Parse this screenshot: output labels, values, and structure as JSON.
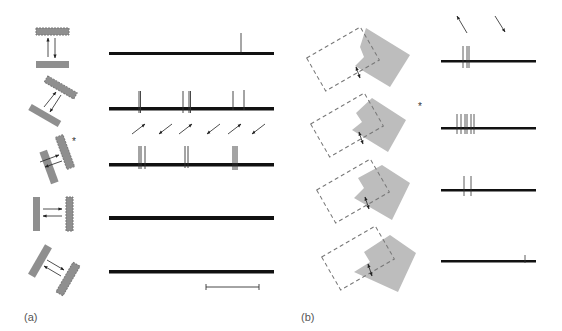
{
  "figure": {
    "panel_a": {
      "label": "(a)",
      "rows": [
        {
          "stimulus": "horizontal-bars-vertical-motion",
          "spikes_x": [
            241
          ],
          "y": 53
        },
        {
          "stimulus": "oblique-bars-upright-motion",
          "spikes_x": [
            139,
            183,
            189,
            232,
            243
          ],
          "y": 108
        },
        {
          "stimulus": "oblique-bars-lower-left-motion-preferred",
          "starred": true,
          "spikes_x": [
            139,
            141,
            145,
            185,
            188,
            233,
            235,
            237
          ],
          "y": 164
        },
        {
          "stimulus": "vertical-bars-horizontal-motion",
          "spikes_x": [],
          "y": 218
        },
        {
          "stimulus": "oblique-bars-reverse-motion",
          "spikes_x": [],
          "y": 272
        }
      ],
      "direction_arrows": [
        "up-right",
        "down-left",
        "up-right",
        "down-left",
        "up-right",
        "down-left"
      ],
      "scale_bar": {
        "x1": 206,
        "x2": 259,
        "y": 287
      }
    },
    "panel_b": {
      "label": "(b)",
      "top_arrows": [
        "up-left",
        "down-right"
      ],
      "rows": [
        {
          "stimulus": "occluded-corner-1",
          "spikes_x": [
            463,
            467,
            469
          ],
          "y": 61
        },
        {
          "stimulus": "occluded-corner-2",
          "starred": true,
          "spikes_x": [
            457,
            461,
            465,
            467,
            471,
            474
          ],
          "y": 128
        },
        {
          "stimulus": "occluded-corner-3",
          "spikes_x": [
            464,
            471
          ],
          "y": 190
        },
        {
          "stimulus": "occluded-corner-4",
          "spikes_x": [
            525
          ],
          "y": 261
        }
      ]
    },
    "star_symbol": "*",
    "colors": {
      "bar_gray": "#8f8f8f",
      "shade_gray": "#bdbdbd",
      "trace": "#111111",
      "dash": "#777777"
    }
  }
}
